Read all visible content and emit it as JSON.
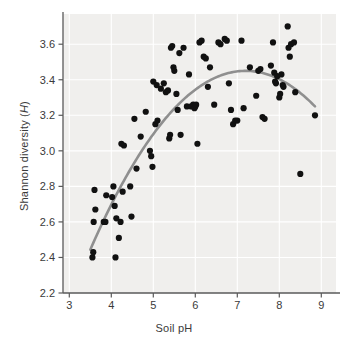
{
  "chart_data": {
    "type": "scatter",
    "title": "",
    "xlabel": "Soil pH",
    "ylabel_plain": "Shannon diversity (H)",
    "ylabel_prefix": "Shannon diversity (",
    "ylabel_italic": "H",
    "ylabel_suffix": ")",
    "xlim": [
      2.85,
      9.35
    ],
    "ylim": [
      2.2,
      3.77
    ],
    "xticks": [
      3,
      4,
      5,
      6,
      7,
      8,
      9
    ],
    "xtick_labels": [
      "3",
      "4",
      "5",
      "6",
      "7",
      "8",
      "9"
    ],
    "yticks": [
      2.2,
      2.4,
      2.6,
      2.8,
      3.0,
      3.2,
      3.4,
      3.6
    ],
    "ytick_labels": [
      "2.2",
      "2.4",
      "2.6",
      "2.8",
      "3.0",
      "3.2",
      "3.4",
      "3.6"
    ],
    "grid": true,
    "grid_color": "#ffffff",
    "plot_background": "#f0efed",
    "point_color": "#111111",
    "point_radius": 3.1,
    "legend": "none",
    "series": [
      {
        "name": "Soil samples",
        "marker": "circle",
        "points": [
          [
            3.55,
            2.4
          ],
          [
            3.57,
            2.43
          ],
          [
            3.58,
            2.6
          ],
          [
            3.6,
            2.78
          ],
          [
            3.62,
            2.67
          ],
          [
            3.82,
            2.6
          ],
          [
            3.86,
            2.6
          ],
          [
            3.88,
            2.75
          ],
          [
            4.02,
            2.74
          ],
          [
            4.05,
            2.8
          ],
          [
            4.08,
            2.69
          ],
          [
            4.1,
            2.4
          ],
          [
            4.12,
            2.62
          ],
          [
            4.18,
            2.51
          ],
          [
            4.22,
            2.6
          ],
          [
            4.24,
            3.04
          ],
          [
            4.27,
            2.77
          ],
          [
            4.3,
            3.03
          ],
          [
            4.45,
            2.8
          ],
          [
            4.48,
            2.63
          ],
          [
            4.55,
            3.18
          ],
          [
            4.6,
            2.9
          ],
          [
            4.7,
            3.08
          ],
          [
            4.82,
            3.22
          ],
          [
            4.92,
            3.0
          ],
          [
            4.95,
            2.97
          ],
          [
            4.98,
            2.91
          ],
          [
            5.0,
            3.39
          ],
          [
            5.05,
            3.15
          ],
          [
            5.08,
            3.37
          ],
          [
            5.1,
            3.17
          ],
          [
            5.18,
            3.35
          ],
          [
            5.25,
            3.38
          ],
          [
            5.3,
            3.33
          ],
          [
            5.35,
            3.34
          ],
          [
            5.38,
            3.07
          ],
          [
            5.4,
            3.09
          ],
          [
            5.42,
            3.58
          ],
          [
            5.45,
            3.59
          ],
          [
            5.48,
            3.47
          ],
          [
            5.5,
            3.45
          ],
          [
            5.55,
            3.32
          ],
          [
            5.58,
            3.23
          ],
          [
            5.62,
            3.55
          ],
          [
            5.65,
            3.09
          ],
          [
            5.72,
            3.58
          ],
          [
            5.8,
            3.25
          ],
          [
            5.85,
            3.43
          ],
          [
            5.9,
            3.25
          ],
          [
            5.95,
            3.26
          ],
          [
            5.98,
            3.24
          ],
          [
            6.0,
            3.25
          ],
          [
            6.02,
            3.26
          ],
          [
            6.05,
            3.04
          ],
          [
            6.1,
            3.61
          ],
          [
            6.15,
            3.62
          ],
          [
            6.2,
            3.53
          ],
          [
            6.25,
            3.52
          ],
          [
            6.3,
            3.36
          ],
          [
            6.35,
            3.47
          ],
          [
            6.45,
            3.26
          ],
          [
            6.55,
            3.61
          ],
          [
            6.6,
            3.6
          ],
          [
            6.7,
            3.63
          ],
          [
            6.75,
            3.62
          ],
          [
            6.8,
            3.38
          ],
          [
            6.85,
            3.23
          ],
          [
            6.9,
            3.15
          ],
          [
            6.95,
            3.17
          ],
          [
            7.0,
            3.17
          ],
          [
            7.1,
            3.62
          ],
          [
            7.15,
            3.24
          ],
          [
            7.3,
            3.47
          ],
          [
            7.45,
            3.31
          ],
          [
            7.5,
            3.45
          ],
          [
            7.55,
            3.46
          ],
          [
            7.6,
            3.19
          ],
          [
            7.65,
            3.18
          ],
          [
            7.8,
            3.48
          ],
          [
            7.85,
            3.61
          ],
          [
            7.88,
            3.44
          ],
          [
            7.9,
            3.39
          ],
          [
            7.92,
            3.38
          ],
          [
            7.95,
            3.42
          ],
          [
            8.0,
            3.3
          ],
          [
            8.02,
            3.32
          ],
          [
            8.05,
            3.43
          ],
          [
            8.08,
            3.37
          ],
          [
            8.1,
            3.36
          ],
          [
            8.2,
            3.7
          ],
          [
            8.22,
            3.58
          ],
          [
            8.25,
            3.53
          ],
          [
            8.28,
            3.6
          ],
          [
            8.35,
            3.61
          ],
          [
            8.38,
            3.33
          ],
          [
            8.5,
            2.87
          ],
          [
            8.85,
            3.2
          ]
        ]
      }
    ],
    "fit_curve": {
      "name": "quadratic fit",
      "color": "#8f8f8f",
      "width": 2.6,
      "x_start": 3.5,
      "x_end": 8.85,
      "vertex_x": 7.2,
      "vertex_y": 3.45,
      "curvature": -0.0735
    }
  }
}
